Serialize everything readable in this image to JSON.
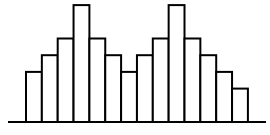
{
  "chart_data": {
    "type": "bar",
    "title": "",
    "xlabel": "",
    "ylabel": "",
    "categories": [
      "1",
      "2",
      "3",
      "4",
      "5",
      "6",
      "7",
      "8",
      "9",
      "10",
      "11",
      "12",
      "13",
      "14"
    ],
    "values": [
      3,
      4,
      5,
      7,
      5,
      4,
      3,
      4,
      5,
      7,
      5,
      4,
      3,
      2
    ],
    "ylim": [
      0,
      7
    ],
    "grid": false,
    "legend": null,
    "style": {
      "bar_fill": "#ffffff",
      "bar_stroke": "#000000",
      "axis_color": "#000000"
    }
  }
}
